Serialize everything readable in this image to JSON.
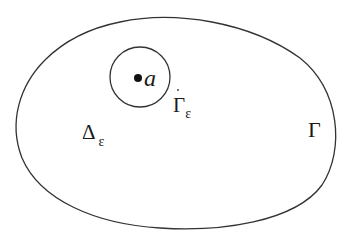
{
  "diagram": {
    "outer_curve": {
      "label": "Γ",
      "stroke": "#333333"
    },
    "inner_circle": {
      "label_main": "Γ",
      "label_sub": "ε",
      "stroke": "#333333"
    },
    "point": {
      "label": "a",
      "color": "#111111"
    },
    "region": {
      "label_main": "Δ",
      "label_sub": "ε"
    }
  }
}
